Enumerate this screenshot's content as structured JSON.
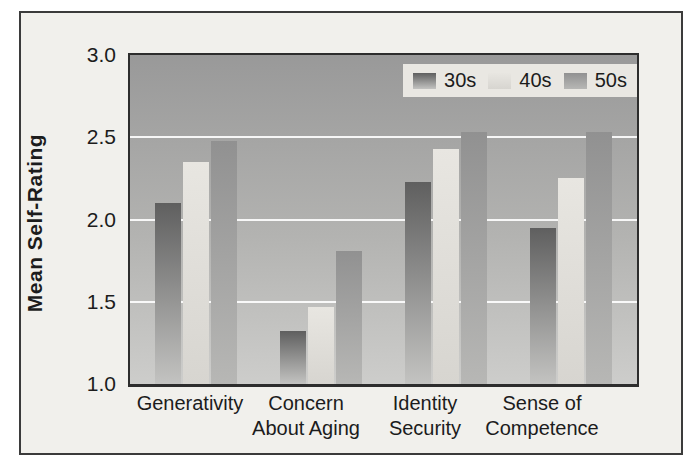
{
  "chart_data": {
    "type": "bar",
    "title": "",
    "ylabel": "Mean Self-Rating",
    "xlabel": "",
    "ylim": [
      1.0,
      3.0
    ],
    "yticks": [
      3.0,
      2.5,
      2.0,
      1.5,
      1.0
    ],
    "gridlines": [
      2.5,
      2.0,
      1.5
    ],
    "grid_on": true,
    "grid_color": "#ffffff",
    "legend_position": "top-right",
    "categories": [
      "Generativity",
      "Concern About Aging",
      "Identity Security",
      "Sense of Competence"
    ],
    "category_label_lines": [
      [
        "Generativity"
      ],
      [
        "Concern",
        "About Aging"
      ],
      [
        "Identity",
        "Security"
      ],
      [
        "Sense of",
        "Competence"
      ]
    ],
    "series": [
      {
        "name": "30s",
        "values": [
          2.1,
          1.32,
          2.23,
          1.95
        ],
        "color_top": "#5f5f5f",
        "color_bottom": "#c3c3c1"
      },
      {
        "name": "40s",
        "values": [
          2.35,
          1.47,
          2.43,
          2.25
        ],
        "color_top": "#e8e6e1",
        "color_bottom": "#d7d5d0"
      },
      {
        "name": "50s",
        "values": [
          2.48,
          1.81,
          2.53,
          2.53
        ],
        "color_top": "#919191",
        "color_bottom": "#b7b7b5"
      }
    ],
    "colors": {
      "plot_bg_top": "#999999",
      "plot_bg_bottom": "#cdcdcb",
      "frame_bg": "#f1f0ec",
      "legend_bg": "#e9e7e2",
      "axis": "#2d2d2d",
      "text": "#1c1c1c"
    }
  }
}
